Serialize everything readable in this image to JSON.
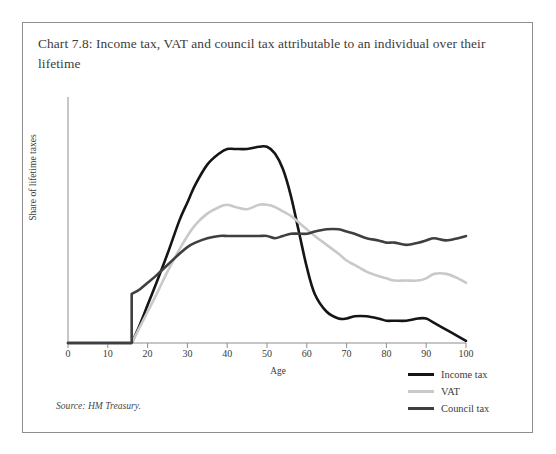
{
  "chart_data": {
    "type": "line",
    "title": "Chart 7.8: Income tax, VAT and council tax attributable to an individual over their lifetime",
    "xlabel": "Age",
    "ylabel": "Share of lifetime taxes",
    "xlim": [
      0,
      100
    ],
    "ylim": [
      0,
      100
    ],
    "grid": false,
    "legend_position": "bottom-right",
    "source": "Source: HM Treasury.",
    "xticks": [
      0,
      10,
      20,
      30,
      40,
      50,
      60,
      70,
      80,
      90,
      100
    ],
    "yticks": [],
    "x": [
      0,
      5,
      10,
      15,
      16,
      18,
      20,
      22,
      25,
      28,
      30,
      32,
      35,
      38,
      40,
      42,
      45,
      48,
      50,
      52,
      54,
      56,
      58,
      60,
      62,
      65,
      68,
      70,
      72,
      75,
      78,
      80,
      82,
      85,
      88,
      90,
      92,
      95,
      98,
      100
    ],
    "series": [
      {
        "name": "Income tax",
        "color": "#151515",
        "values": [
          0,
          0,
          0,
          0,
          0,
          8,
          17,
          26,
          40,
          55,
          63,
          71,
          80,
          85,
          87,
          87,
          87,
          88,
          88,
          85,
          78,
          66,
          50,
          34,
          22,
          14,
          11,
          11,
          12,
          12,
          11,
          10,
          10,
          10,
          11,
          11,
          9,
          6,
          3,
          1
        ]
      },
      {
        "name": "VAT",
        "color": "#c9c9c9",
        "values": [
          0,
          0,
          0,
          0,
          0,
          7,
          14,
          21,
          32,
          42,
          48,
          53,
          58,
          61,
          62,
          61,
          60,
          62,
          62,
          61,
          59,
          57,
          54,
          51,
          48,
          44,
          40,
          37,
          35,
          32,
          30,
          29,
          28,
          28,
          28,
          29,
          31,
          31,
          29,
          27
        ]
      },
      {
        "name": "Council tax",
        "color": "#3f3f3f",
        "values": [
          0,
          0,
          0,
          0,
          22,
          24,
          27,
          30,
          35,
          40,
          43,
          45,
          47,
          48,
          48,
          48,
          48,
          48,
          48,
          47,
          48,
          49,
          49,
          49,
          50,
          51,
          51,
          50,
          49,
          47,
          46,
          45,
          45,
          44,
          45,
          46,
          47,
          46,
          47,
          48
        ]
      }
    ]
  },
  "legend": {
    "items": [
      {
        "label": "Income tax",
        "color": "#151515"
      },
      {
        "label": "VAT",
        "color": "#c9c9c9"
      },
      {
        "label": "Council tax",
        "color": "#3f3f3f"
      }
    ]
  }
}
